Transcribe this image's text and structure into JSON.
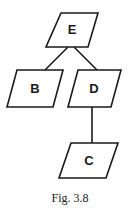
{
  "diagram": {
    "type": "tree",
    "stroke_color": "#1a1a1a",
    "nodes": [
      {
        "id": "E",
        "label": "E"
      },
      {
        "id": "B",
        "label": "B"
      },
      {
        "id": "D",
        "label": "D"
      },
      {
        "id": "C",
        "label": "C"
      }
    ],
    "edges": [
      {
        "from": "E",
        "to": "B"
      },
      {
        "from": "E",
        "to": "D"
      },
      {
        "from": "D",
        "to": "C"
      }
    ]
  },
  "caption": "Fig. 3.8"
}
